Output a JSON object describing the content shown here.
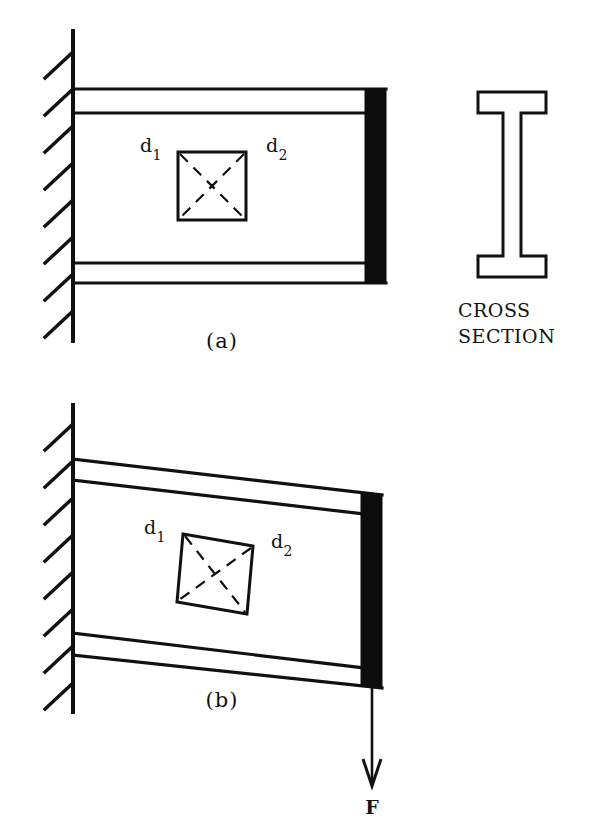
{
  "figure": {
    "stroke_color": "#111111",
    "fill_block_color": "#0d0d0d",
    "background_color": "#ffffff"
  },
  "panel_a": {
    "caption": "(a)",
    "state": "undeformed",
    "element_label_left": "d",
    "element_label_left_sub": "1",
    "element_label_right": "d",
    "element_label_right_sub": "2"
  },
  "panel_b": {
    "caption": "(b)",
    "state": "deformed",
    "element_label_left": "d",
    "element_label_left_sub": "1",
    "element_label_right": "d",
    "element_label_right_sub": "2",
    "force_label": "F"
  },
  "cross_section": {
    "line1": "CROSS",
    "line2": "SECTION",
    "shape": "i-beam"
  }
}
